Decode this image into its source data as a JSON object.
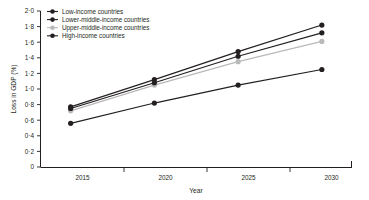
{
  "chart_data": {
    "type": "line",
    "title": "",
    "xlabel": "Year",
    "ylabel": "Loss in GDP (%)",
    "x": [
      2015,
      2020,
      2025,
      2030
    ],
    "xtick_labels": [
      "2015",
      "2020",
      "2025",
      "2030"
    ],
    "ytick_labels": [
      "0",
      "0·2",
      "0·4",
      "0·6",
      "0·8",
      "1·0",
      "1·2",
      "1·4",
      "1·6",
      "1·8",
      "2·0"
    ],
    "ytick_values": [
      0,
      0.2,
      0.4,
      0.6,
      0.8,
      1.0,
      1.2,
      1.4,
      1.6,
      1.8,
      2.0
    ],
    "ylim": [
      0,
      2.0
    ],
    "xlim": [
      2013.2,
      2031.8
    ],
    "grid": false,
    "legend_position": "top-left",
    "series": [
      {
        "name": "Low-income countries",
        "color": "#231f20",
        "marker": "circle",
        "values": [
          0.56,
          0.82,
          1.05,
          1.25
        ]
      },
      {
        "name": "Lower-middle-income countries",
        "color": "#231f20",
        "marker": "circle",
        "values": [
          0.77,
          1.12,
          1.48,
          1.82
        ]
      },
      {
        "name": "Upper-middle-income countries",
        "color": "#b9b9b9",
        "marker": "circle",
        "values": [
          0.72,
          1.05,
          1.35,
          1.61
        ]
      },
      {
        "name": "High-income countries",
        "color": "#231f20",
        "marker": "circle",
        "values": [
          0.75,
          1.08,
          1.42,
          1.72
        ]
      }
    ]
  },
  "legend": {
    "items": [
      {
        "label": "Low-income countries",
        "color": "#231f20"
      },
      {
        "label": "Lower-middle-income countries",
        "color": "#231f20"
      },
      {
        "label": "Upper-middle-income countries",
        "color": "#b9b9b9"
      },
      {
        "label": "High-income countries",
        "color": "#231f20"
      }
    ]
  },
  "axes": {
    "y_label": "Loss in GDP (%)",
    "x_label": "Year",
    "y_ticks": [
      "2·0",
      "1·8",
      "1·6",
      "1·4",
      "1·2",
      "1·0",
      "0·8",
      "0·6",
      "0·4",
      "0·2",
      "0"
    ],
    "x_ticks": [
      "2015",
      "2020",
      "2025",
      "2030"
    ]
  }
}
